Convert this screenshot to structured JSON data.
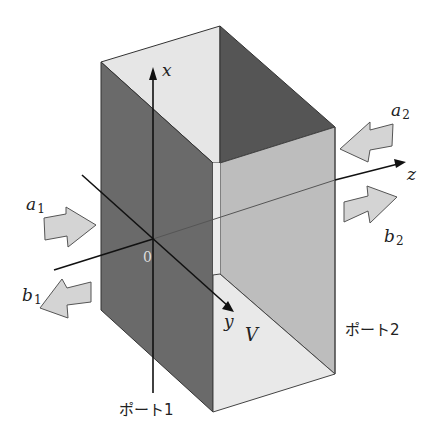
{
  "figure": {
    "colors": {
      "left_panel": "#6a6a6a",
      "top_face": "#e6e6e6",
      "back_face": "#555555",
      "right_panel": "#bdbdbd",
      "floor": "#e9e9e9",
      "strip": "#ececec",
      "arrow_fill": "#d4d4d4",
      "arrow_stroke": "#555555",
      "axis": "#111111"
    }
  },
  "axes": {
    "x": {
      "label": "x"
    },
    "y": {
      "label": "y"
    },
    "z": {
      "label": "z"
    },
    "origin": {
      "label": "0"
    }
  },
  "waves": {
    "a1": {
      "base": "a",
      "sub": "1",
      "direction": "incoming to port 1"
    },
    "b1": {
      "base": "b",
      "sub": "1",
      "direction": "outgoing from port 1"
    },
    "a2": {
      "base": "a",
      "sub": "2",
      "direction": "incoming to port 2"
    },
    "b2": {
      "base": "b",
      "sub": "2",
      "direction": "outgoing from port 2"
    }
  },
  "region": {
    "label": "V"
  },
  "ports": {
    "port1": "ポート1",
    "port2": "ポート2"
  }
}
